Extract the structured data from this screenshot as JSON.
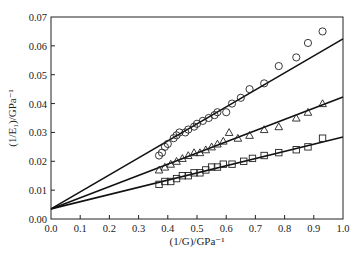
{
  "chart_data": {
    "type": "scatter",
    "title": "",
    "xlabel": "(1/G)/GPa⁻¹",
    "ylabel": "(1/E₁)/GPa⁻¹",
    "xlim": [
      0.0,
      1.0
    ],
    "ylim": [
      0.0,
      0.07
    ],
    "xticks": [
      "0.0",
      "0.1",
      "0.2",
      "0.3",
      "0.4",
      "0.5",
      "0.6",
      "0.7",
      "0.8",
      "0.9",
      "1.0"
    ],
    "yticks": [
      "0.00",
      "0.01",
      "0.02",
      "0.03",
      "0.04",
      "0.05",
      "0.06",
      "0.07"
    ],
    "grid": false,
    "legend": "none",
    "series": [
      {
        "name": "circles",
        "marker": "circle",
        "points": [
          [
            0.37,
            0.022
          ],
          [
            0.38,
            0.023
          ],
          [
            0.39,
            0.025
          ],
          [
            0.4,
            0.026
          ],
          [
            0.42,
            0.028
          ],
          [
            0.43,
            0.029
          ],
          [
            0.44,
            0.03
          ],
          [
            0.46,
            0.03
          ],
          [
            0.47,
            0.031
          ],
          [
            0.49,
            0.032
          ],
          [
            0.5,
            0.033
          ],
          [
            0.52,
            0.034
          ],
          [
            0.54,
            0.035
          ],
          [
            0.56,
            0.036
          ],
          [
            0.57,
            0.037
          ],
          [
            0.6,
            0.037
          ],
          [
            0.62,
            0.04
          ],
          [
            0.65,
            0.042
          ],
          [
            0.68,
            0.045
          ],
          [
            0.73,
            0.047
          ],
          [
            0.78,
            0.053
          ],
          [
            0.84,
            0.056
          ],
          [
            0.88,
            0.061
          ],
          [
            0.93,
            0.065
          ]
        ],
        "fit_line": {
          "intercept": 0.0035,
          "value_at_1": 0.0624
        }
      },
      {
        "name": "triangles",
        "marker": "triangle",
        "points": [
          [
            0.37,
            0.017
          ],
          [
            0.39,
            0.018
          ],
          [
            0.41,
            0.019
          ],
          [
            0.43,
            0.02
          ],
          [
            0.45,
            0.021
          ],
          [
            0.47,
            0.022
          ],
          [
            0.49,
            0.023
          ],
          [
            0.51,
            0.023
          ],
          [
            0.53,
            0.024
          ],
          [
            0.55,
            0.025
          ],
          [
            0.57,
            0.026
          ],
          [
            0.59,
            0.027
          ],
          [
            0.61,
            0.03
          ],
          [
            0.64,
            0.028
          ],
          [
            0.68,
            0.029
          ],
          [
            0.73,
            0.031
          ],
          [
            0.78,
            0.032
          ],
          [
            0.84,
            0.035
          ],
          [
            0.88,
            0.037
          ],
          [
            0.93,
            0.04
          ]
        ],
        "fit_line": {
          "intercept": 0.0035,
          "value_at_1": 0.0423
        }
      },
      {
        "name": "squares",
        "marker": "square",
        "points": [
          [
            0.37,
            0.012
          ],
          [
            0.39,
            0.013
          ],
          [
            0.41,
            0.013
          ],
          [
            0.43,
            0.014
          ],
          [
            0.45,
            0.015
          ],
          [
            0.47,
            0.015
          ],
          [
            0.49,
            0.016
          ],
          [
            0.51,
            0.016
          ],
          [
            0.53,
            0.017
          ],
          [
            0.55,
            0.018
          ],
          [
            0.57,
            0.018
          ],
          [
            0.59,
            0.019
          ],
          [
            0.62,
            0.019
          ],
          [
            0.66,
            0.02
          ],
          [
            0.69,
            0.021
          ],
          [
            0.73,
            0.022
          ],
          [
            0.78,
            0.023
          ],
          [
            0.84,
            0.024
          ],
          [
            0.88,
            0.025
          ],
          [
            0.93,
            0.028
          ]
        ],
        "fit_line": {
          "intercept": 0.0035,
          "value_at_1": 0.0284
        }
      }
    ]
  }
}
